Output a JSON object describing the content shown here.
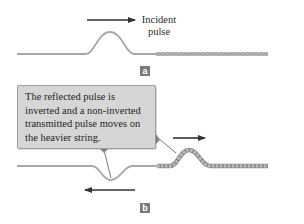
{
  "panel_a": {
    "arrow_label_line1": "Incident",
    "arrow_label_line2": "pulse",
    "tag": "a"
  },
  "panel_b": {
    "callout_text": "The reflected pulse is inverted and a non-inverted transmitted pulse moves on the heavier string.",
    "tag": "b"
  },
  "colors": {
    "light_string": "#a8a8a8",
    "heavy_string": "#b0b0b0",
    "arrow": "#333333",
    "callout_bg": "#d6d6d6",
    "tag_bg": "#7a7a7a"
  }
}
